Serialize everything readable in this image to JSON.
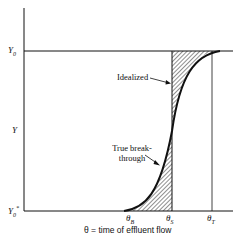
{
  "diagram": {
    "y_axis_labels": {
      "top": "Y",
      "top_sub": "0",
      "middle": "Y",
      "bottom": "Y",
      "bottom_sub": "0",
      "bottom_sup": "*"
    },
    "x_axis_labels": [
      {
        "main": "θ",
        "sub": "B"
      },
      {
        "main": "θ",
        "sub": "S"
      },
      {
        "main": "θ",
        "sub": "T"
      }
    ],
    "annotations": {
      "idealized": "Idealized",
      "true_breakthrough_line1": "True break-",
      "true_breakthrough_line2": "through"
    },
    "x_axis_title": "θ = time of effluent flow",
    "colors": {
      "line": "#111111",
      "background": "#ffffff"
    }
  }
}
